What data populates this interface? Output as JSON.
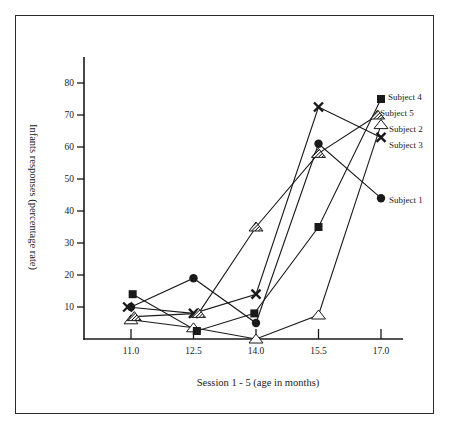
{
  "chart_data": {
    "type": "line",
    "title": "",
    "xlabel": "Session 1 - 5 (age in months)",
    "ylabel": "Infants responses (percentage rate)",
    "x": [
      11.0,
      12.5,
      14.0,
      15.5,
      17.0
    ],
    "x_tick_labels": [
      "11.0",
      "12.5",
      "14.0",
      "15.5",
      "17.0"
    ],
    "y_ticks": [
      10,
      20,
      30,
      40,
      50,
      60,
      70,
      80
    ],
    "y_tick_labels": [
      "10",
      "20",
      "30",
      "40",
      "50",
      "60",
      "70",
      "80"
    ],
    "xlim": [
      9.9,
      17.8
    ],
    "ylim": [
      0,
      87
    ],
    "grid": false,
    "legend_placement": "right-end-labels",
    "series": [
      {
        "name": "Subject 1",
        "marker": "circle",
        "values": [
          10,
          19,
          5,
          61,
          44
        ]
      },
      {
        "name": "Subject 2",
        "marker": "open-triangle",
        "values": [
          6,
          3.5,
          0,
          7.5,
          67
        ]
      },
      {
        "name": "Subject 3",
        "marker": "x",
        "values": [
          10,
          8,
          14,
          72.5,
          63
        ]
      },
      {
        "name": "Subject 4",
        "marker": "square",
        "values": [
          14,
          2.5,
          8,
          35,
          75
        ]
      },
      {
        "name": "Subject 5",
        "marker": "hatched-triangle",
        "values": [
          7,
          8,
          35,
          58,
          70
        ]
      }
    ]
  },
  "colors": {
    "ink": "#1a1a1a",
    "background": "#ffffff"
  }
}
